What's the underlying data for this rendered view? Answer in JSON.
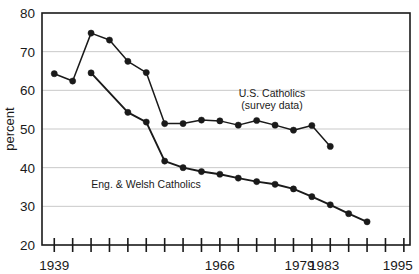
{
  "chart_data": {
    "type": "line",
    "title": "",
    "xlabel": "",
    "ylabel": "percent",
    "ylim": [
      20,
      80
    ],
    "ytick_values": [
      20,
      30,
      40,
      50,
      60,
      70,
      80
    ],
    "ytick_labels": [
      "20",
      "30",
      "40",
      "50",
      "60",
      "70",
      "80"
    ],
    "xlim": [
      1937,
      1997
    ],
    "xtick_labels": [
      "1939",
      "1966",
      "1979",
      "1983",
      "1995"
    ],
    "xtick_label_years": [
      1939,
      1966,
      1979,
      1983,
      1995
    ],
    "xtick_minor_years": [
      1939,
      1942,
      1945,
      1948,
      1951,
      1954,
      1957,
      1960,
      1963,
      1966,
      1969,
      1972,
      1975,
      1978,
      1981,
      1984,
      1987,
      1990,
      1993,
      1996
    ],
    "grid": "horizontal",
    "legend_position": "inline-annotations",
    "series": [
      {
        "name": "U.S. Catholics (survey data)",
        "style": "thin-line-no-markers",
        "color": "#1a1a1a",
        "points": [
          [
            1939,
            64.3
          ],
          [
            1942,
            62.4
          ],
          [
            1945,
            74.8
          ],
          [
            1948,
            73.0
          ],
          [
            1951,
            67.5
          ],
          [
            1954,
            64.6
          ],
          [
            1957,
            51.4
          ],
          [
            1960,
            51.4
          ],
          [
            1963,
            52.3
          ],
          [
            1966,
            52.1
          ],
          [
            1969,
            51.0
          ],
          [
            1972,
            52.2
          ],
          [
            1975,
            51.0
          ],
          [
            1978,
            49.7
          ],
          [
            1981,
            50.9
          ],
          [
            1984,
            45.5
          ]
        ]
      },
      {
        "name": "Eng. & Welsh Catholics",
        "style": "thick-line-round-markers",
        "color": "#1a1a1a",
        "points": [
          [
            1945,
            64.5
          ],
          [
            1951,
            54.3
          ],
          [
            1954,
            51.8
          ],
          [
            1957,
            41.7
          ],
          [
            1960,
            40.0
          ],
          [
            1963,
            39.0
          ],
          [
            1966,
            38.3
          ],
          [
            1969,
            37.3
          ],
          [
            1972,
            36.4
          ],
          [
            1975,
            35.7
          ],
          [
            1978,
            34.5
          ],
          [
            1981,
            32.5
          ],
          [
            1984,
            30.4
          ],
          [
            1987,
            28.1
          ],
          [
            1990,
            26.0
          ]
        ]
      }
    ],
    "annotations": [
      {
        "name": "us-catholics-label",
        "lines": [
          "U.S. Catholics",
          "(survey data)"
        ],
        "x_px": 272,
        "y_px": 97
      },
      {
        "name": "eng-welsh-catholics-label",
        "lines": [
          "Eng. & Welsh Catholics"
        ],
        "x_px": 146,
        "y_px": 188
      }
    ]
  },
  "axis": {
    "y_title": "percent"
  },
  "colors": {
    "line": "#1a1a1a",
    "grid": "#c9c9c9",
    "frame": "#1a1a1a",
    "background": "#ffffff"
  }
}
